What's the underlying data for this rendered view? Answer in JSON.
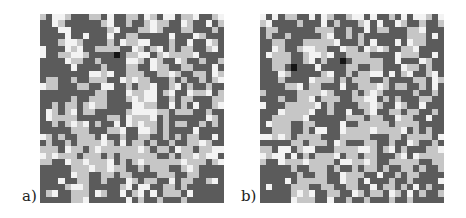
{
  "figure": {
    "panels": [
      {
        "id": "a",
        "label": "a)",
        "grid_size": [
          30,
          30
        ],
        "rows": [
          "LDWWLDDDLLDWDDLLDWLDWWDLLWDDLW",
          "DDWLDDDDDDLWDDLDDLWLLDDWLDDWDL",
          "DDDWWDDDDDDLWDDDLLWLDDDLLDDDLD",
          "DDDDWDDWDDDWDDLLDDDDDWDDDWLDDD",
          "DDDLWWLDDDDLDWLLWWDDDLDDWDDWLD",
          "WDDDWLWDDLLLLDDWLDLWDLDLLDDLWD",
          "WDDLLWWLDDDDKDLLWWDLWLLLLWDDDD",
          "DDDDWLLDDLDDDDWWLDWLDDWLDDLDDL",
          "DDDDDWDDDDLDDDLLDDWLLDDLLDDDWD",
          "DDDDDDDDWWLWDDLLLDDLLWLDDLLDWL",
          "DLLDDLDDLLLDDWLWLLDDDLDLDDLDLW",
          "WLLDDDLLDDWWDDLDLLWDDLWDLDDLDD",
          "DDDDDDDDDLLDDDWLLWWDLWDDWLLWDL",
          "DDDDDLDDLLLDDDLWLWWDDLDLLDDDLL",
          "DDLDLLDLWLLDDDDWWLLDDWDLDWDDLW",
          "DWLDLWDLLDDDDDLWWWWLLDLLLDDLDD",
          "DWLLLLDDDDDLLDWLLLWDLDDDDDDWLD",
          "DDLDLWLWDLDDWDWLWLLDLDLLDDLDLD",
          "DDDDDLLLDDDLLWDDWWLDLDDDDWDDDD",
          "WLDLDDLLLDWDDLDDLLDDLDLDLLDDWD",
          "DLDDLDLLLLWLDWDLLDLDDLDDLLWLDD",
          "LLLDWLLDLWLLLLLLWLDLLDWLLDLLWW",
          "WLWLLLDLLLDLDLLLLLLDDLDLLWLWWD",
          "LLDDWLLWLLLWDLDLWLLLLLLWLLLDLW",
          "DDDDDLLLWLLWLLDDLDLLLDDLWLDDDD",
          "DDDDDWLLDDLLDLLDDDDLLLDDLLDDDD",
          "DDDWDDLLDDLDDDWLDLLDDWDLLDDLWD",
          "DDDDLWWLDDDDDLWDWWDDLLDLDDDDDD",
          "DLWDDLLLDWLDDWDLWDWDLLLDWDDDDD",
          "DDDDDLLWDDDDDDWDLDDLDDDLDDDDDD"
        ]
      },
      {
        "id": "b",
        "label": "b)",
        "grid_size": [
          30,
          30
        ],
        "rows": [
          "WDWDLLDDWDWLDDLWWDWDDLDWDWWLDW",
          "LWDDDDLDDDWDLDDDLWDWDDWLDDLDDL",
          "DLLDDDDDDLLLDDLDDWDLLDDDLLWDDD",
          "DLDDLDDDDDLWDDLDLDDDDDDDLLLDWD",
          "DDLLDDDLLLLLWDDDLDWDDDWDWLLDDD",
          "DDWLDDLWWLLDDWLLDWLWLDDLLWDDDD",
          "DWLLLDDLWWLWDDLLLLDDDDWLLLDDWD",
          "DDLLLDDLWDLDDKDLLLLLDDWDDDWLDD",
          "DDLLDKDDDWDDDDLLDDLLDDDWLLDLDD",
          "DDDWLDDDDDLWDDLDLLWWDWDLWDDLWD",
          "DDDLDDDDWLLLDLDLLLDDLDDDDLLDWL",
          "DDDDLLWDLLDDDWDDLLLWLDLLDDLDWD",
          "LDDDDDLLLLWLDDDLDLWLDDDDDLDDLD",
          "DDDLDDLLWDLLLDDLLWWDLDLDDDLLDD",
          "WDDDLLLLLWDLDDDDLLWLDDWLDDWDDD",
          "DDDWLLLLWDDLDDWDDLWDDLLDLLDDLD",
          "DDLLLLLWDDDDDDLLLDLLDDWLLDDWDD",
          "DWLLLDDLLDDDDWDDLLLLLDLLLLDDDD",
          "DDLLLDDLDWWDDWLLLLWLLLLWDLDLDD",
          "WWLWLDLLLLDDDLLLLLDDDLLDLLLLDW",
          "DDDDDLLDLLLDWLDDDLLDDLDDWLDDLD",
          "LLDWWDLWWDDDLLLLWWLDLWDLDDDLLW",
          "WLWWDWDLDLLLWDLLDLLDDDLWDWLLLL",
          "LDDWLLLWLLLLDWWLLWLDDLLLLLDDLL",
          "DDDDDLDDLLLDLDDLDLLDLDDLLDLDDL",
          "DDDDDDLDDLLDDWLLLDDWDDLDLLDDDD",
          "DDDDWDLLLLLDDWLLDWDDDLDDLDDDDW",
          "DWDDDLLLDDLLDDLLDDWDLLDLDWDLDD",
          "DDDDDLWLWDDLLDDWLDLLDWLDWDLDDL",
          "DDDDDWLLLDDWDDLDDLDDDLDDLDDDDD"
        ]
      }
    ],
    "palette": {
      "D": "#5b5b5b",
      "L": "#c6c6c6",
      "W": "#f3f3f3",
      "K": "#141414"
    },
    "legend_semantics": {
      "D": "dark-gray-cell",
      "L": "light-gray-cell",
      "W": "white-cell",
      "K": "black-highlight-cell"
    }
  }
}
